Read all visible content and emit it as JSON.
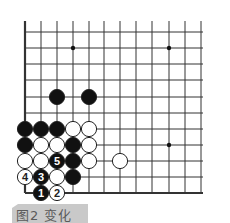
{
  "figure": {
    "caption": "图2  变化",
    "grid": {
      "columns_x": [
        25,
        41,
        57,
        73,
        89,
        104,
        120,
        136,
        152,
        169,
        185,
        201
      ],
      "rows_y": [
        32,
        48,
        64,
        80,
        97,
        113,
        129,
        145,
        161,
        177,
        193
      ],
      "top_y": 21,
      "line_color": "#333333",
      "edges": [
        "left",
        "bottom"
      ]
    },
    "star_points": [
      [
        73,
        48
      ],
      [
        169,
        48
      ],
      [
        169,
        145
      ]
    ],
    "stones": [
      {
        "color": "black",
        "x": 57,
        "y": 97
      },
      {
        "color": "black",
        "x": 89,
        "y": 97
      },
      {
        "color": "black",
        "x": 25,
        "y": 129
      },
      {
        "color": "black",
        "x": 41,
        "y": 129
      },
      {
        "color": "black",
        "x": 57,
        "y": 129
      },
      {
        "color": "white",
        "x": 73,
        "y": 129
      },
      {
        "color": "white",
        "x": 89,
        "y": 129
      },
      {
        "color": "black",
        "x": 25,
        "y": 145
      },
      {
        "color": "white",
        "x": 41,
        "y": 145
      },
      {
        "color": "white",
        "x": 57,
        "y": 145
      },
      {
        "color": "black",
        "x": 73,
        "y": 145
      },
      {
        "color": "white",
        "x": 89,
        "y": 145
      },
      {
        "color": "white",
        "x": 25,
        "y": 161
      },
      {
        "color": "white",
        "x": 41,
        "y": 161
      },
      {
        "color": "black",
        "x": 57,
        "y": 161,
        "label": "5"
      },
      {
        "color": "black",
        "x": 73,
        "y": 161
      },
      {
        "color": "white",
        "x": 89,
        "y": 161
      },
      {
        "color": "white",
        "x": 120,
        "y": 161
      },
      {
        "color": "white",
        "x": 25,
        "y": 177,
        "label": "4"
      },
      {
        "color": "black",
        "x": 41,
        "y": 177,
        "label": "3"
      },
      {
        "color": "white",
        "x": 57,
        "y": 177
      },
      {
        "color": "black",
        "x": 73,
        "y": 177
      },
      {
        "color": "black",
        "x": 41,
        "y": 193,
        "label": "1"
      },
      {
        "color": "white",
        "x": 57,
        "y": 193,
        "label": "2"
      }
    ]
  }
}
